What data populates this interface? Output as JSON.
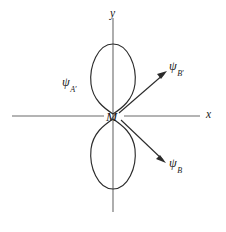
{
  "figure": {
    "domain_type": "diagram",
    "background_color": "#ffffff",
    "stroke_color": "#2b2b2b",
    "axis_color": "#6b6b6b"
  },
  "axes": {
    "x_axis": {
      "label": "x",
      "label_x": 206,
      "label_y": 109,
      "line_start_x": 12,
      "line_end_x": 200,
      "line_y": 116
    },
    "y_axis": {
      "label": "y",
      "label_x": 110,
      "label_y": 8,
      "line_top_y": 18,
      "line_bottom_y": 212,
      "line_x": 113
    },
    "origin": {
      "label": "M",
      "x": 113,
      "y": 116
    }
  },
  "lobes": [
    {
      "name": "upper-lobe",
      "orientation": "up",
      "tip_x": 113,
      "tip_y": 114,
      "top_y": 43,
      "half_width": 22
    },
    {
      "name": "lower-lobe",
      "orientation": "down",
      "tip_x": 113,
      "tip_y": 119,
      "bottom_y": 190,
      "half_width": 22
    }
  ],
  "arrows": [
    {
      "name": "arrow-psi-b-upper",
      "from_x": 119,
      "from_y": 113,
      "to_x": 166,
      "to_y": 72
    },
    {
      "name": "arrow-psi-b-lower",
      "from_x": 121,
      "from_y": 120,
      "to_x": 166,
      "to_y": 162
    }
  ],
  "labels": {
    "psi_a": {
      "symbol": "ψ",
      "subscript": "A",
      "prime": "′",
      "full": "ψA′"
    },
    "psi_b_upper": {
      "symbol": "ψ",
      "subscript": "B",
      "prime": "′",
      "full": "ψB′"
    },
    "psi_b_lower": {
      "symbol": "ψ",
      "subscript": "B",
      "prime": "",
      "full": "ψB"
    },
    "center": "M",
    "axis_x": "x",
    "axis_y": "y"
  }
}
